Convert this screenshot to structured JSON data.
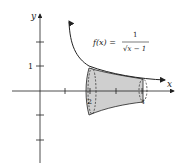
{
  "diagram": {
    "axis_x_label": "x",
    "axis_y_label": "y",
    "function_label_lhs": "f(x) =",
    "function_numerator": "1",
    "function_denominator": "√x − 1",
    "y_tick_label": "1",
    "x_label_2": "2",
    "x_label_4": "4",
    "colors": {
      "fill": "#cfcfcf",
      "stroke": "#222222"
    }
  }
}
